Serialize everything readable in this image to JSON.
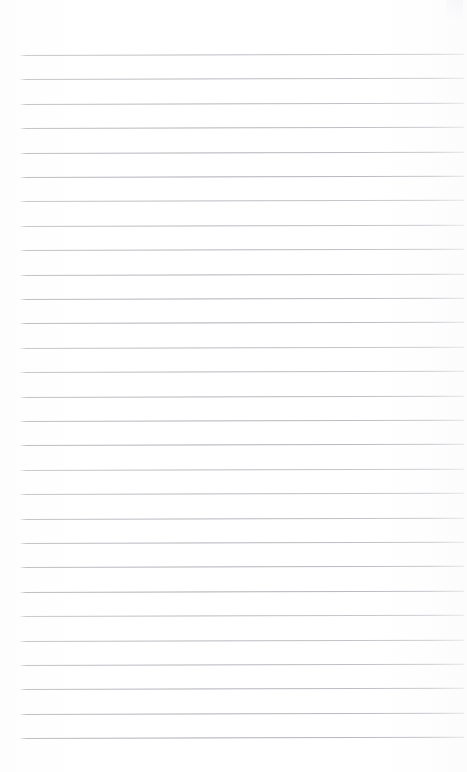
{
  "document": {
    "kind": "lined-notepad-page",
    "title": "Blank ruled notepad page",
    "page_width": 467,
    "page_height": 772,
    "background_color": "#fefefe",
    "has_text": false,
    "text_content": "",
    "margin_note": ""
  },
  "ruling": {
    "line_color": "#b6b6bc",
    "line_thickness_px": 1,
    "line_count": 29,
    "first_line_y": 55,
    "line_spacing_px": 24.4,
    "line_start_x": 20,
    "line_end_x": 464,
    "slant_px": -1.2,
    "top_margin_px": 55,
    "bottom_margin_px": 45
  },
  "icons": {
    "scan-artifact": "scan-artifact-icon"
  }
}
